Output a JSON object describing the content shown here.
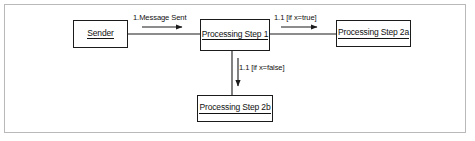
{
  "diagram": {
    "type": "uml-communication-diagram",
    "frame": {
      "border_color": "#b9b9b9",
      "background": "#ffffff"
    },
    "line_color": "#1b1b1b",
    "nodes": [
      {
        "id": "sender",
        "label": "Sender",
        "underlined": true
      },
      {
        "id": "step1",
        "label": "Processing Step 1",
        "underlined": true
      },
      {
        "id": "step2a",
        "label": "Processing Step 2a",
        "underlined": true
      },
      {
        "id": "step2b",
        "label": "Processing Step 2b",
        "underlined": true
      }
    ],
    "edges": [
      {
        "id": "sender-to-step1",
        "from": "sender",
        "to": "step1",
        "label": "1.Message Sent",
        "direction": "right"
      },
      {
        "id": "step1-to-step2a",
        "from": "step1",
        "to": "step2a",
        "label": "1.1 [if x=true]",
        "direction": "right"
      },
      {
        "id": "step1-to-step2b",
        "from": "step1",
        "to": "step2b",
        "label": "1.1 [if x=false]",
        "direction": "down"
      }
    ]
  }
}
